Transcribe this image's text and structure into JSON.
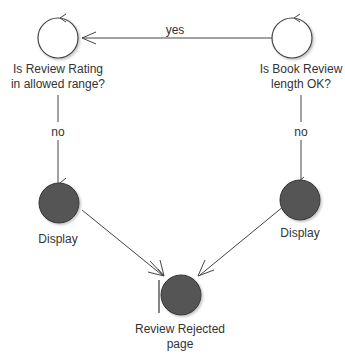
{
  "diagram": {
    "type": "statechart",
    "colors": {
      "line": "#444444",
      "filled_state": "#555555",
      "text": "#333333"
    },
    "nodes": [
      {
        "id": "rating_check",
        "kind": "choice-state",
        "label_lines": [
          "Is Review Rating",
          "in allowed range?"
        ]
      },
      {
        "id": "length_check",
        "kind": "choice-state",
        "label_lines": [
          "Is Book Review",
          "length OK?"
        ]
      },
      {
        "id": "display_left",
        "kind": "filled-state",
        "label_lines": [
          "Display"
        ]
      },
      {
        "id": "display_right",
        "kind": "filled-state",
        "label_lines": [
          "Display"
        ]
      },
      {
        "id": "rejected",
        "kind": "filled-state-with-bar",
        "label_lines": [
          "Review Rejected",
          "page"
        ]
      }
    ],
    "edges": [
      {
        "from": "length_check",
        "to": "rating_check",
        "label": "yes"
      },
      {
        "from": "rating_check",
        "to": "display_left",
        "label": "no"
      },
      {
        "from": "length_check",
        "to": "display_right",
        "label": "no"
      },
      {
        "from": "display_left",
        "to": "rejected",
        "label": ""
      },
      {
        "from": "display_right",
        "to": "rejected",
        "label": ""
      }
    ]
  }
}
